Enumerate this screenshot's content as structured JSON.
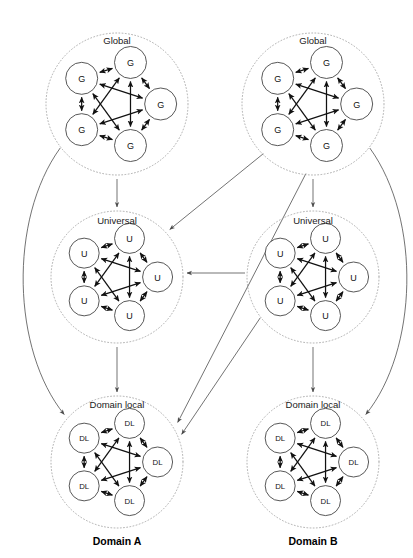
{
  "diagram": {
    "background": "#ffffff",
    "node_stroke": "#3a3a3a",
    "ring_stroke": "#9a9a9a",
    "internal_link_color": "#111111",
    "cross_link_color": "#5a5a5a"
  },
  "domains": [
    {
      "id": "domain-a",
      "label": "Domain A",
      "label_pos": {
        "x": 117,
        "y": 545
      },
      "clusters": [
        {
          "id": "a-global",
          "title": "Global",
          "node_label": "G",
          "node_count": 5,
          "center": {
            "x": 117,
            "y": 104
          },
          "ring_r": 71,
          "node_r": 16,
          "title_pos": {
            "x": 117,
            "y": 44
          }
        },
        {
          "id": "a-universal",
          "title": "Universal",
          "node_label": "U",
          "node_count": 5,
          "center": {
            "x": 117,
            "y": 277
          },
          "ring_r": 66,
          "node_r": 15,
          "title_pos": {
            "x": 117,
            "y": 224
          }
        },
        {
          "id": "a-domain-local",
          "title": "Domain local",
          "node_label": "DL",
          "node_count": 5,
          "center": {
            "x": 117,
            "y": 462
          },
          "ring_r": 66,
          "node_r": 15,
          "title_pos": {
            "x": 117,
            "y": 408
          }
        }
      ]
    },
    {
      "id": "domain-b",
      "label": "Domain B",
      "label_pos": {
        "x": 313,
        "y": 545
      },
      "clusters": [
        {
          "id": "b-global",
          "title": "Global",
          "node_label": "G",
          "node_count": 5,
          "center": {
            "x": 313,
            "y": 104
          },
          "ring_r": 71,
          "node_r": 16,
          "title_pos": {
            "x": 313,
            "y": 44
          }
        },
        {
          "id": "b-universal",
          "title": "Universal",
          "node_label": "U",
          "node_count": 5,
          "center": {
            "x": 313,
            "y": 277
          },
          "ring_r": 66,
          "node_r": 15,
          "title_pos": {
            "x": 313,
            "y": 224
          }
        },
        {
          "id": "b-domain-local",
          "title": "Domain local",
          "node_label": "DL",
          "node_count": 5,
          "center": {
            "x": 313,
            "y": 462
          },
          "ring_r": 66,
          "node_r": 15,
          "title_pos": {
            "x": 313,
            "y": 408
          }
        }
      ]
    }
  ],
  "connections": [
    {
      "id": "a-global-to-a-universal",
      "from": "a-global",
      "to": "a-universal",
      "kind": "vertical",
      "arrow": "single"
    },
    {
      "id": "a-universal-to-a-domain-local",
      "from": "a-universal",
      "to": "a-domain-local",
      "kind": "vertical",
      "arrow": "single"
    },
    {
      "id": "b-global-to-b-universal",
      "from": "b-global",
      "to": "b-universal",
      "kind": "vertical",
      "arrow": "single"
    },
    {
      "id": "b-universal-to-b-domain-local",
      "from": "b-universal",
      "to": "b-domain-local",
      "kind": "vertical",
      "arrow": "single"
    },
    {
      "id": "a-global-to-a-domain-local",
      "from": "a-global",
      "to": "a-domain-local",
      "kind": "curve-left",
      "arrow": "single"
    },
    {
      "id": "b-global-to-b-domain-local",
      "from": "b-global",
      "to": "b-domain-local",
      "kind": "curve-right",
      "arrow": "single"
    },
    {
      "id": "b-global-to-a-universal",
      "from": "b-global",
      "to": "a-universal",
      "kind": "diagonal",
      "arrow": "single"
    },
    {
      "id": "b-global-to-a-domain-local",
      "from": "b-global",
      "to": "a-domain-local",
      "kind": "diagonal",
      "arrow": "single"
    },
    {
      "id": "b-universal-to-a-universal",
      "from": "b-universal",
      "to": "a-universal",
      "kind": "horizontal",
      "arrow": "single"
    },
    {
      "id": "b-universal-to-a-domain-local",
      "from": "b-universal",
      "to": "a-domain-local",
      "kind": "diagonal",
      "arrow": "single"
    }
  ],
  "cluster_topology": {
    "description": "Each cluster is a fully connected pentagon of 5 nodes with bidirectional arrows on all 10 pairs",
    "node_angles_deg": [
      234,
      306,
      162,
      18,
      90
    ],
    "pair_count": 10,
    "arrow": "double"
  }
}
